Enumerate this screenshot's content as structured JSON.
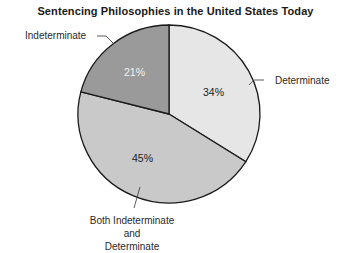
{
  "chart_data": {
    "type": "pie",
    "title": "Sentencing Philosophies in the United States Today",
    "slices": [
      {
        "label": "Determinate",
        "value": 34,
        "display": "34%",
        "color": "#e6e6e6"
      },
      {
        "label": "Both Indeterminate and Determinate",
        "value": 45,
        "display": "45%",
        "color": "#c9c9c9"
      },
      {
        "label": "Indeterminate",
        "value": 21,
        "display": "21%",
        "color": "#9a9a9a"
      }
    ],
    "legend": "none (callout labels)",
    "start_angle": "12 o'clock, clockwise"
  },
  "labels": {
    "determinate": "Determinate",
    "indeterminate": "Indeterminate",
    "both_line1": "Both Indeterminate",
    "both_line2": "and",
    "both_line3": "Determinate"
  }
}
